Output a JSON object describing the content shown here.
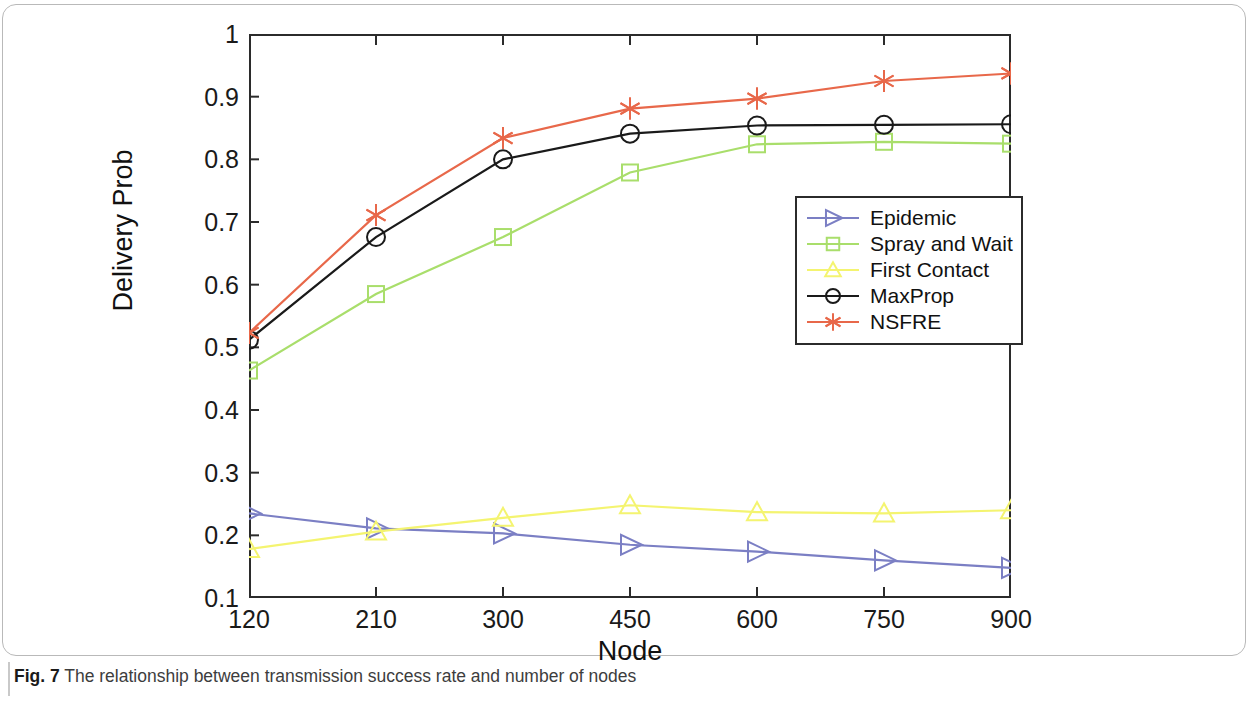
{
  "figure": {
    "caption_label": "Fig. 7",
    "caption_text": "The relationship between transmission success rate and number of nodes"
  },
  "chart_data": {
    "type": "line",
    "title": "",
    "xlabel": "Node",
    "ylabel": "Delivery Prob",
    "categories": [
      "120",
      "210",
      "300",
      "450",
      "600",
      "750",
      "900"
    ],
    "xticks": [
      "120",
      "210",
      "300",
      "450",
      "600",
      "750",
      "900"
    ],
    "yticks": [
      "0.1",
      "0.2",
      "0.3",
      "0.4",
      "0.5",
      "0.6",
      "0.7",
      "0.8",
      "0.9",
      "1"
    ],
    "ylim": [
      0.1,
      1.0
    ],
    "grid": false,
    "legend_position": "center-right",
    "series": [
      {
        "name": "Epidemic",
        "color": "#7b7fc4",
        "marker": "triangle-right",
        "values": [
          0.235,
          0.211,
          0.203,
          0.185,
          0.174,
          0.16,
          0.148
        ]
      },
      {
        "name": "Spray and Wait",
        "color": "#a9de6b",
        "marker": "square",
        "values": [
          0.463,
          0.585,
          0.676,
          0.779,
          0.824,
          0.828,
          0.825
        ]
      },
      {
        "name": "First Contact",
        "color": "#f4f470",
        "marker": "triangle-up",
        "values": [
          0.178,
          0.206,
          0.228,
          0.248,
          0.237,
          0.235,
          0.24
        ]
      },
      {
        "name": "MaxProp",
        "color": "#1a1a1a",
        "marker": "circle",
        "values": [
          0.512,
          0.676,
          0.8,
          0.841,
          0.854,
          0.855,
          0.856
        ]
      },
      {
        "name": "NSFRE",
        "color": "#e8684a",
        "marker": "asterisk",
        "values": [
          0.523,
          0.711,
          0.834,
          0.881,
          0.897,
          0.925,
          0.937
        ]
      }
    ]
  }
}
